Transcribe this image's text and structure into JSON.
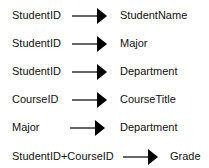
{
  "diagram": {
    "type": "functional-dependencies",
    "dependencies": [
      {
        "determinant": "StudentID",
        "dependent": "StudentName"
      },
      {
        "determinant": "StudentID",
        "dependent": "Major"
      },
      {
        "determinant": "StudentID",
        "dependent": "Department"
      },
      {
        "determinant": "CourseID",
        "dependent": "CourseTitle"
      },
      {
        "determinant": "Major",
        "dependent": "Department"
      },
      {
        "determinant": "StudentID+CourseID",
        "dependent": "Grade"
      }
    ],
    "arrow_glyph": "arrow-right-icon",
    "colors": {
      "text": "#111111",
      "arrow": "#000000",
      "background": "#ffffff"
    }
  }
}
